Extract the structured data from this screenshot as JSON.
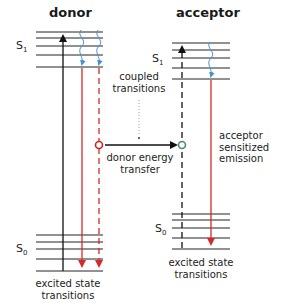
{
  "donor": {
    "title": "donor",
    "s1_label": "S",
    "s1_sub": "1",
    "s0_label": "S",
    "s0_sub": "0",
    "bottom_label_line1": "excited state",
    "bottom_label_line2": "transitions"
  },
  "acceptor": {
    "title": "acceptor",
    "s1_label": "S",
    "s1_sub": "1",
    "s0_label": "S",
    "s0_sub": "0",
    "bottom_label_line1": "excited state",
    "bottom_label_line2": "transitions",
    "emission_line1": "acceptor",
    "emission_line2": "sensitized",
    "emission_line3": "emission"
  },
  "middle": {
    "coupled_line1": "coupled",
    "coupled_line2": "transitions",
    "transfer_line1": "donor energy",
    "transfer_line2": "transfer"
  },
  "colors": {
    "level_line": "#222222",
    "emission_red": "#d42a2a",
    "relaxation_blue": "#4a8fd0",
    "acceptor_circle_green": "#4a8a6a",
    "donor_circle_red": "#cc2222"
  }
}
